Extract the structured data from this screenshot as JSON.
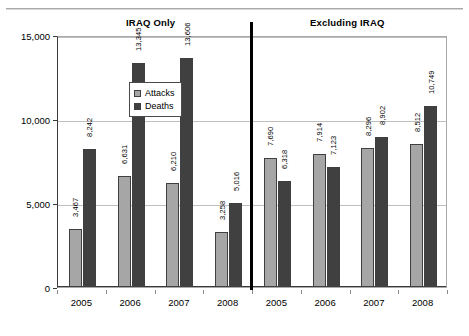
{
  "chart_data": {
    "type": "bar",
    "title": "",
    "xlabel": "",
    "ylabel": "",
    "ylim": [
      0,
      15000
    ],
    "yticks": [
      "0",
      "5,000",
      "10,000",
      "15,000"
    ],
    "ytick_values": [
      0,
      5000,
      10000,
      15000
    ],
    "grid": true,
    "legend_position": "upper-left-inside",
    "panels": [
      {
        "title": "IRAQ Only",
        "categories": [
          "2005",
          "2006",
          "2007",
          "2008"
        ],
        "series": [
          {
            "name": "Attacks",
            "values": [
              3467,
              6631,
              6210,
              3258
            ],
            "labels": [
              "3,467",
              "6,631",
              "6,210",
              "3,258"
            ],
            "color": "#a6a6a6"
          },
          {
            "name": "Deaths",
            "values": [
              8242,
              13345,
              13606,
              5016
            ],
            "labels": [
              "8,242",
              "13,345",
              "13,606",
              "5,016"
            ],
            "color": "#404040"
          }
        ]
      },
      {
        "title": "Excluding IRAQ",
        "categories": [
          "2005",
          "2006",
          "2007",
          "2008"
        ],
        "series": [
          {
            "name": "Attacks",
            "values": [
              7690,
              7914,
              8296,
              8512
            ],
            "labels": [
              "7,690",
              "7,914",
              "8,296",
              "8,512"
            ],
            "color": "#a6a6a6"
          },
          {
            "name": "Deaths",
            "values": [
              6318,
              7123,
              8902,
              10749
            ],
            "labels": [
              "6,318",
              "7,123",
              "8,902",
              "10,749"
            ],
            "color": "#404040"
          }
        ]
      }
    ],
    "legend": [
      {
        "label": "Attacks",
        "color": "#a6a6a6"
      },
      {
        "label": "Deaths",
        "color": "#404040"
      }
    ],
    "colors": {
      "attacks": "#a6a6a6",
      "deaths": "#404040",
      "gridline": "#bfbfbf",
      "axis": "#3a3a3a",
      "divider": "#000000"
    }
  }
}
